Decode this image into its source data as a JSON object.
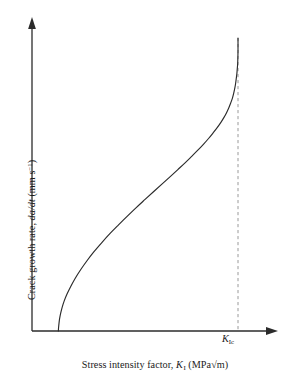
{
  "figure": {
    "name": "crack-growth-rate-vs-stress-intensity-factor",
    "background_color": "#ffffff",
    "line_color": "#2b2b2b",
    "axis_color": "#2b2b2b",
    "dashed_line_color": "#9a9a9a"
  },
  "axes": {
    "y": {
      "label_full": "Crack growth rate, da/dt (mm s-1)",
      "label_prefix": "Crack growth rate, ",
      "label_var": "da/dt",
      "label_units_open": " (mm s",
      "label_units_exp": "−1",
      "label_units_close": ")",
      "arrow": true,
      "ticks": [],
      "tick_labels": []
    },
    "x": {
      "label_full": "Stress intensity factor, KI (MPa√m)",
      "label_prefix": "Stress intensity factor, ",
      "label_var": "K",
      "label_var_sub": "I",
      "label_units": " (MPa√m)",
      "arrow": true,
      "ticks": [],
      "tick_labels": []
    }
  },
  "annotations": {
    "critical_line": {
      "label_var": "K",
      "label_sub": "Ic",
      "style": "dashed-vertical",
      "x_value": 1.0
    }
  },
  "chart_data": {
    "type": "line",
    "title": "",
    "subtitle": "",
    "xlabel": "Stress intensity factor, KI (MPa√m)",
    "ylabel": "Crack growth rate, da/dt (mm s-1)",
    "xlim": [
      0,
      1.18
    ],
    "ylim": [
      0,
      1.0
    ],
    "grid": false,
    "legend": null,
    "legend_position": "none",
    "axis_ticks": "none",
    "series": [
      {
        "name": "crack growth rate",
        "comment": "Sigmoidal stress-corrosion / fatigue crack growth curve: vertical threshold at K-threshold, near-linear Paris regime, vertical asymptote at K_Ic",
        "x": [
          0.128,
          0.129,
          0.131,
          0.134,
          0.139,
          0.146,
          0.156,
          0.17,
          0.188,
          0.21,
          0.236,
          0.266,
          0.3,
          0.338,
          0.378,
          0.42,
          0.463,
          0.506,
          0.549,
          0.591,
          0.632,
          0.671,
          0.708,
          0.743,
          0.775,
          0.805,
          0.832,
          0.857,
          0.879,
          0.899,
          0.917,
          0.932,
          0.945,
          0.956,
          0.965,
          0.973,
          0.979,
          0.984,
          0.988,
          0.991,
          0.994,
          0.996,
          0.998,
          0.999,
          1.0,
          1.0
        ],
        "y": [
          0.0,
          0.012,
          0.026,
          0.042,
          0.06,
          0.08,
          0.102,
          0.126,
          0.152,
          0.18,
          0.209,
          0.239,
          0.27,
          0.301,
          0.332,
          0.362,
          0.392,
          0.421,
          0.449,
          0.476,
          0.502,
          0.527,
          0.551,
          0.574,
          0.596,
          0.617,
          0.637,
          0.657,
          0.676,
          0.694,
          0.712,
          0.729,
          0.746,
          0.763,
          0.779,
          0.795,
          0.811,
          0.827,
          0.843,
          0.859,
          0.875,
          0.891,
          0.908,
          0.925,
          0.955,
          1.0
        ]
      }
    ],
    "vertical_reference_lines": [
      {
        "label": "KIc",
        "x": 1.0,
        "style": "dashed",
        "color": "#9a9a9a"
      }
    ],
    "regions": {
      "threshold_x": 0.128,
      "critical_x": 1.0
    }
  }
}
